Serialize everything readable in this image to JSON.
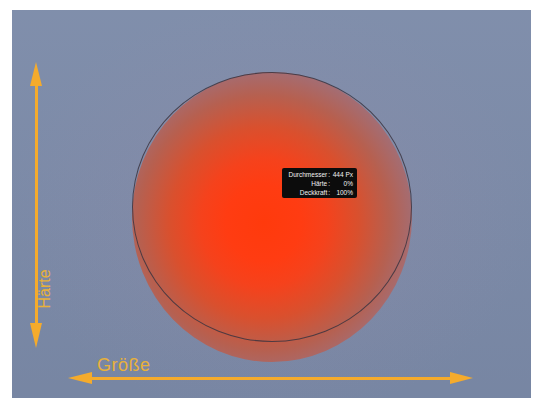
{
  "canvas": {
    "background_color": "#7b8aa8",
    "brush_core_color": "#ff3a0c",
    "guide_color": "#f5ab2c",
    "label_color": "#e8b13a"
  },
  "brush_tooltip": {
    "rows": [
      {
        "label": "Durchmesser",
        "sep": ":",
        "value": "444 Px"
      },
      {
        "label": "Härte",
        "sep": ":",
        "value": "0%"
      },
      {
        "label": "Deckkraft",
        "sep": ":",
        "value": "100%"
      }
    ]
  },
  "guides": {
    "vertical_label": "Härte",
    "horizontal_label": "Größe"
  }
}
